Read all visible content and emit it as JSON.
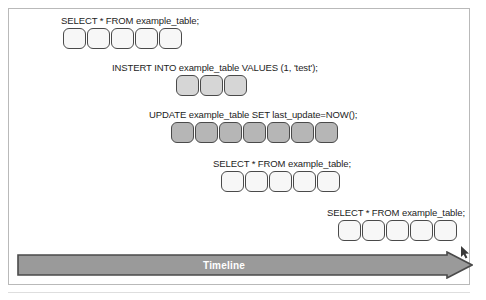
{
  "figure": {
    "frame_color": "#b9b9b9",
    "background_color": "#ffffff"
  },
  "timeline": {
    "label": "Timeline",
    "fill_color": "#9a9a9a",
    "stroke_color": "#4a4a4a",
    "text_color": "#ffffff",
    "direction": "left-to-right"
  },
  "legend_tones": {
    "light": "#f7f7f7",
    "mid": "#d6d6d6",
    "dark": "#b6b6b6"
  },
  "queries": [
    {
      "id": "query-1",
      "label": "SELECT * FROM example_table;",
      "block_count": 5,
      "tone": "light"
    },
    {
      "id": "query-2",
      "label": "INSTERT INTO example_table VALUES (1, 'test');",
      "block_count": 3,
      "tone": "mid"
    },
    {
      "id": "query-3",
      "label": "UPDATE example_table SET last_update=NOW();",
      "block_count": 7,
      "tone": "dark"
    },
    {
      "id": "query-4",
      "label": "SELECT * FROM example_table;",
      "block_count": 5,
      "tone": "light"
    },
    {
      "id": "query-5",
      "label": "SELECT * FROM example_table;",
      "block_count": 5,
      "tone": "light"
    }
  ]
}
